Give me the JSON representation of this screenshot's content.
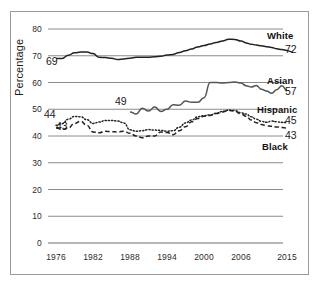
{
  "figure": {
    "background_color": "#ffffff",
    "frame_color": "#9a9a9a",
    "axis_label": "Percentage"
  },
  "chart_data": {
    "type": "line",
    "title": "",
    "xlabel": "",
    "ylabel": "Percentage",
    "xlim": [
      1976,
      2015
    ],
    "ylim": [
      0,
      80
    ],
    "yticks": [
      0,
      10,
      20,
      30,
      40,
      50,
      60,
      70,
      80
    ],
    "xticks": [
      1976,
      1982,
      1988,
      1994,
      2000,
      2006,
      2015
    ],
    "xtick_labels": [
      "1976",
      "1982",
      "1988",
      "1994",
      "2000",
      "2006",
      "2015"
    ],
    "ytick_labels": [
      "0",
      "10",
      "20",
      "30",
      "40",
      "50",
      "60",
      "70",
      "80"
    ],
    "grid": true,
    "grid_axis": "y",
    "legend": "inline-right-labels",
    "series": [
      {
        "name": "White",
        "style": "solid",
        "color": "#222222",
        "start_label": "69",
        "end_label": "72",
        "x": [
          1976,
          1977,
          1978,
          1979,
          1980,
          1981,
          1982,
          1983,
          1984,
          1985,
          1986,
          1987,
          1988,
          1989,
          1990,
          1991,
          1992,
          1993,
          1994,
          1995,
          1996,
          1997,
          1998,
          1999,
          2000,
          2001,
          2002,
          2003,
          2004,
          2005,
          2006,
          2007,
          2008,
          2009,
          2010,
          2011,
          2012,
          2013,
          2014,
          2015
        ],
        "values": [
          69.0,
          69.0,
          70.2,
          71.1,
          71.4,
          71.4,
          70.8,
          69.4,
          69.3,
          69.1,
          68.6,
          68.8,
          69.1,
          69.4,
          69.4,
          69.4,
          69.6,
          69.8,
          70.3,
          70.5,
          71.2,
          71.9,
          72.5,
          73.3,
          73.8,
          74.4,
          75.0,
          75.5,
          76.2,
          76.1,
          75.5,
          74.8,
          74.3,
          74.0,
          73.7,
          73.4,
          73.1,
          72.6,
          72.3,
          72.0
        ]
      },
      {
        "name": "Asian",
        "style": "solid",
        "color": "#555555",
        "start_label": "49",
        "end_label": "57",
        "x": [
          1988,
          1989,
          1990,
          1991,
          1992,
          1993,
          1994,
          1995,
          1996,
          1997,
          1998,
          1999,
          2000,
          2001,
          2002,
          2003,
          2004,
          2005,
          2006,
          2007,
          2008,
          2009,
          2010,
          2011,
          2012,
          2013,
          2014,
          2015
        ],
        "values": [
          49.0,
          48.2,
          50.4,
          49.3,
          50.8,
          49.2,
          50.0,
          51.7,
          51.5,
          53.1,
          52.6,
          52.6,
          54.3,
          60.0,
          60.0,
          59.8,
          60.0,
          60.2,
          59.8,
          58.8,
          58.3,
          58.9,
          57.5,
          56.8,
          56.0,
          57.3,
          58.8,
          57.0
        ]
      },
      {
        "name": "Hispanic",
        "style": "dotted",
        "color": "#222222",
        "start_label": "44",
        "end_label": "45",
        "x": [
          1976,
          1977,
          1978,
          1979,
          1980,
          1981,
          1982,
          1983,
          1984,
          1985,
          1986,
          1987,
          1988,
          1989,
          1990,
          1991,
          1992,
          1993,
          1994,
          1995,
          1996,
          1997,
          1998,
          1999,
          2000,
          2001,
          2002,
          2003,
          2004,
          2005,
          2006,
          2007,
          2008,
          2009,
          2010,
          2011,
          2012,
          2013,
          2014,
          2015
        ],
        "values": [
          44.0,
          44.6,
          46.3,
          47.3,
          47.2,
          46.1,
          44.7,
          45.2,
          45.8,
          45.8,
          45.6,
          44.9,
          42.3,
          41.8,
          42.0,
          42.4,
          42.2,
          42.1,
          41.8,
          42.0,
          43.3,
          44.9,
          46.0,
          47.2,
          47.6,
          47.9,
          48.5,
          49.2,
          49.6,
          49.5,
          48.7,
          48.2,
          47.2,
          46.3,
          45.5,
          45.1,
          45.6,
          45.3,
          45.1,
          45.0
        ]
      },
      {
        "name": "Black",
        "style": "dashed",
        "color": "#222222",
        "start_label": "43",
        "end_label": "43",
        "x": [
          1976,
          1977,
          1978,
          1979,
          1980,
          1981,
          1982,
          1983,
          1984,
          1985,
          1986,
          1987,
          1988,
          1989,
          1990,
          1991,
          1992,
          1993,
          1994,
          1995,
          1996,
          1997,
          1998,
          1999,
          2000,
          2001,
          2002,
          2003,
          2004,
          2005,
          2006,
          2007,
          2008,
          2009,
          2010,
          2011,
          2012,
          2013,
          2014,
          2015
        ],
        "values": [
          43.0,
          42.5,
          43.0,
          44.7,
          45.5,
          44.0,
          41.5,
          41.2,
          41.8,
          41.6,
          41.5,
          41.8,
          41.0,
          40.0,
          39.3,
          40.0,
          40.0,
          41.5,
          41.3,
          40.5,
          42.0,
          43.5,
          45.3,
          46.5,
          47.4,
          47.7,
          48.4,
          49.0,
          49.6,
          49.3,
          48.2,
          47.4,
          46.0,
          45.0,
          44.3,
          43.8,
          43.6,
          43.4,
          43.2,
          43.0
        ]
      }
    ]
  }
}
